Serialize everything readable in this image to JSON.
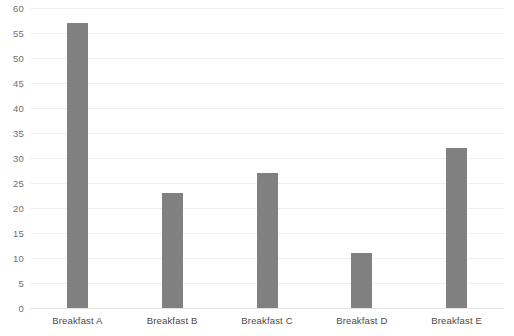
{
  "chart_data": {
    "type": "bar",
    "title": "",
    "subtitle": "",
    "xlabel": "",
    "ylabel": "",
    "categories": [
      "Breakfast A",
      "Breakfast B",
      "Breakfast C",
      "Breakfast D",
      "Breakfast E"
    ],
    "values": [
      57,
      23,
      27,
      11,
      32
    ],
    "ylim": [
      0,
      60
    ],
    "ytick_labels": [
      "0",
      "5",
      "10",
      "15",
      "20",
      "25",
      "30",
      "35",
      "40",
      "45",
      "50",
      "55",
      "60"
    ],
    "ytick_values": [
      0,
      5,
      10,
      15,
      20,
      25,
      30,
      35,
      40,
      45,
      50,
      55,
      60
    ],
    "grid": true,
    "legend": false,
    "legend_position": "none",
    "bar_color": "#808080",
    "gridline_color": "#f0f0f0",
    "axis_color": "#e3e3e3",
    "background_color": "#ffffff",
    "tick_label_color": "#6f6f6f",
    "category_label_color": "#4a4a4a"
  }
}
